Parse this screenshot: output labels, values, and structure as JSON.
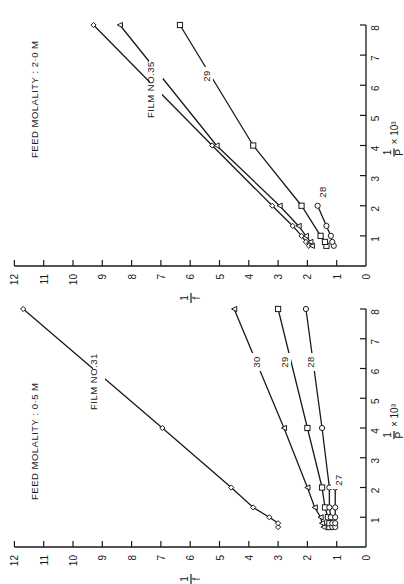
{
  "chart_data": [
    {
      "type": "line",
      "title": "FEED MOLALITY : 2·0 M",
      "xlabel": "1/P × 10³",
      "ylabel": "1/f",
      "xlim": [
        0,
        8
      ],
      "ylim": [
        0,
        12
      ],
      "xticks": [
        "0",
        "1",
        "2",
        "3",
        "4",
        "5",
        "6",
        "7",
        "8"
      ],
      "yticks": [
        "0",
        "1",
        "2",
        "3",
        "4",
        "5",
        "6",
        "7",
        "8",
        "9",
        "10",
        "11",
        "12"
      ],
      "orientation": "rotated-90-ccw",
      "annotation": "FILM NO.",
      "series": [
        {
          "name": "35",
          "marker": "diamond",
          "x": [
            0.67,
            0.8,
            1.0,
            1.33,
            2.0,
            4.0,
            8.0
          ],
          "y": [
            1.95,
            2.05,
            2.2,
            2.5,
            3.2,
            5.25,
            9.3
          ]
        },
        {
          "name": "30",
          "marker": "triangle",
          "x": [
            0.67,
            0.8,
            1.0,
            1.33,
            2.0,
            4.0,
            8.0
          ],
          "y": [
            1.85,
            1.9,
            2.05,
            2.3,
            2.95,
            5.1,
            8.4
          ]
        },
        {
          "name": "29",
          "marker": "square",
          "x": [
            0.67,
            0.8,
            1.0,
            2.0,
            4.0,
            8.0
          ],
          "y": [
            1.35,
            1.4,
            1.55,
            2.2,
            3.85,
            6.35
          ]
        },
        {
          "name": "28",
          "marker": "circle",
          "x": [
            0.67,
            0.8,
            1.0,
            1.33,
            2.0
          ],
          "y": [
            1.1,
            1.15,
            1.2,
            1.35,
            1.65
          ]
        }
      ]
    },
    {
      "type": "line",
      "title": "FEED MOLALITY : 0·5 M",
      "xlabel": "1/P × 10³",
      "ylabel": "1/f",
      "xlim": [
        0,
        8
      ],
      "ylim": [
        0,
        12
      ],
      "xticks": [
        "0",
        "1",
        "2",
        "3",
        "4",
        "5",
        "6",
        "7",
        "8"
      ],
      "yticks": [
        "0",
        "1",
        "2",
        "3",
        "4",
        "5",
        "6",
        "7",
        "8",
        "9",
        "10",
        "11",
        "12"
      ],
      "orientation": "rotated-90-ccw",
      "annotation": "FILM NO.",
      "series": [
        {
          "name": "31",
          "marker": "diamond",
          "x": [
            0.67,
            0.8,
            1.0,
            1.33,
            2.0,
            4.0,
            8.0
          ],
          "y": [
            3.0,
            3.0,
            3.3,
            3.85,
            4.6,
            6.95,
            11.7
          ]
        },
        {
          "name": "30",
          "marker": "triangle",
          "x": [
            0.67,
            0.8,
            1.0,
            1.33,
            2.0,
            4.0,
            8.0
          ],
          "y": [
            1.45,
            1.5,
            1.55,
            1.75,
            2.0,
            2.8,
            4.5
          ]
        },
        {
          "name": "29",
          "marker": "square",
          "x": [
            0.67,
            0.8,
            1.0,
            1.33,
            2.0,
            4.0,
            8.0
          ],
          "y": [
            1.25,
            1.25,
            1.3,
            1.4,
            1.5,
            2.0,
            3.0
          ]
        },
        {
          "name": "28",
          "marker": "circle",
          "x": [
            0.67,
            0.8,
            1.0,
            1.33,
            2.0,
            4.0,
            8.0
          ],
          "y": [
            1.15,
            1.15,
            1.2,
            1.25,
            1.25,
            1.5,
            2.05
          ]
        },
        {
          "name": "27",
          "marker": "circle",
          "x": [
            0.67,
            0.8,
            1.0,
            1.33,
            2.0
          ],
          "y": [
            1.05,
            1.05,
            1.05,
            1.05,
            1.05
          ]
        }
      ]
    }
  ],
  "labels": {
    "top_title": "FEED MOLALITY : 2·0 M",
    "bottom_title": "FEED MOLALITY : 0·5 M",
    "top_film": "FILM NO.35",
    "bottom_film": "FILM NO.31",
    "ylabel": "1/f",
    "xlabel_num": "1",
    "xlabel_den": "P",
    "xlabel_mult": "× 10³"
  }
}
